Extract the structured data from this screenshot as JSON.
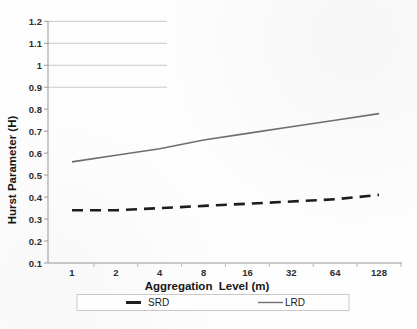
{
  "chart_data": {
    "type": "line",
    "x_scale": "logarithmic (base-2 categories)",
    "categories": [
      "1",
      "2",
      "4",
      "8",
      "16",
      "32",
      "64",
      "128"
    ],
    "series": [
      {
        "name": "SRD",
        "style": "dashed",
        "color": "#1d1d1d",
        "stroke_width": 2.6,
        "dash_pattern": "11 7",
        "values": [
          0.34,
          0.34,
          0.35,
          0.36,
          0.37,
          0.38,
          0.39,
          0.41
        ]
      },
      {
        "name": "LRD",
        "style": "solid",
        "color": "#6e6e6e",
        "stroke_width": 1.6,
        "dash_pattern": "",
        "values": [
          0.56,
          0.59,
          0.62,
          0.66,
          0.69,
          0.72,
          0.75,
          0.78
        ]
      }
    ],
    "title": "",
    "xlabel": "Aggregation  Level (m)",
    "ylabel": "Hurst Parameter (H)",
    "ylim": [
      0.1,
      1.2
    ],
    "y_ticks": [
      "0.1",
      "0.2",
      "0.3",
      "0.4",
      "0.5",
      "0.6",
      "0.7",
      "0.8",
      "0.9",
      "1",
      "1.1",
      "1.2"
    ],
    "y_tick_values": [
      0.1,
      0.2,
      0.3,
      0.4,
      0.5,
      0.6,
      0.7,
      0.8,
      0.9,
      1.0,
      1.1,
      1.2
    ],
    "partial_top_gridlines_at": [
      0.9,
      1.0,
      1.1,
      1.2
    ],
    "grid": "partial horizontal gridlines only (top of plot, truncated)",
    "legend": {
      "position": "bottom",
      "entries": [
        "SRD",
        "LRD"
      ]
    },
    "colors": {
      "axis": "#979797",
      "gridline": "#c9c9c9",
      "tick_text": "#2e2e2e",
      "background": "#fdfdfd"
    }
  }
}
